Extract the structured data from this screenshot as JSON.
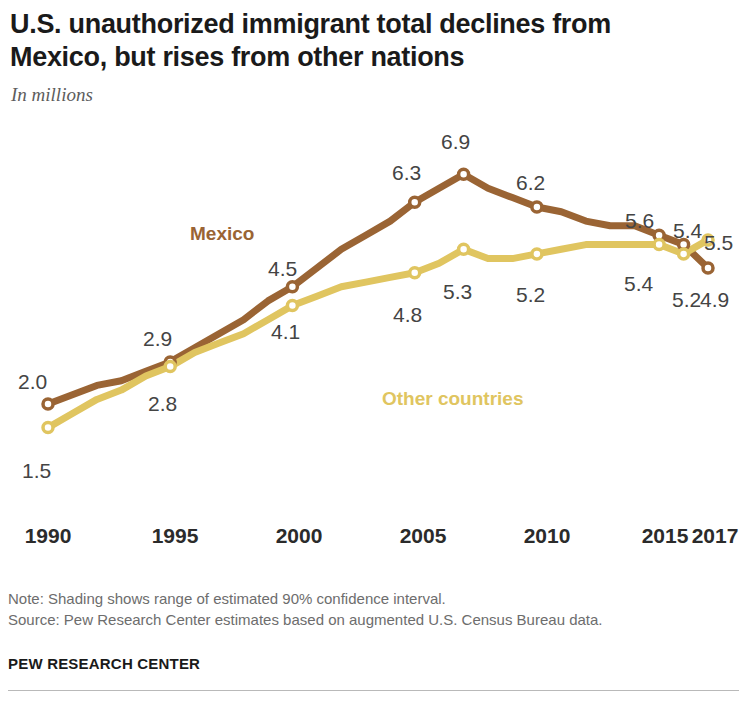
{
  "header": {
    "title": "U.S. unauthorized immigrant total declines from Mexico, but rises from other nations",
    "subtitle": "In millions"
  },
  "footer": {
    "note": "Note: Shading shows range of estimated 90% confidence interval.",
    "source": "Source: Pew Research Center estimates based on augmented U.S. Census Bureau data.",
    "brand": "PEW RESEARCH CENTER"
  },
  "colors": {
    "mexico": "#9a6434",
    "other": "#e0c560",
    "label": "#444444",
    "axis": "#2b2b2b",
    "title": "#1a1a1a",
    "note": "#6d6d6d"
  },
  "chart_data": {
    "type": "line",
    "title": "U.S. unauthorized immigrant total declines from Mexico, but rises from other nations",
    "subtitle": "In millions",
    "xlabel": "",
    "ylabel": "In millions",
    "ylim": [
      0,
      7.5
    ],
    "xlim": [
      1990,
      2017
    ],
    "grid": false,
    "legend_position": "inline",
    "xticks": [
      "1990",
      "1995",
      "2000",
      "2005",
      "2010",
      "2015",
      "2017"
    ],
    "xtick_values": [
      1990,
      1995,
      2000,
      2005,
      2010,
      2015,
      2017
    ],
    "x": [
      1990,
      1991,
      1992,
      1993,
      1994,
      1995,
      1996,
      1997,
      1998,
      1999,
      2000,
      2001,
      2002,
      2003,
      2004,
      2005,
      2006,
      2007,
      2008,
      2009,
      2010,
      2011,
      2012,
      2013,
      2014,
      2015,
      2016,
      2017
    ],
    "series": [
      {
        "name": "Mexico",
        "color": "#9a6434",
        "values": [
          2.0,
          2.2,
          2.4,
          2.5,
          2.7,
          2.9,
          3.2,
          3.5,
          3.8,
          4.2,
          4.5,
          4.9,
          5.3,
          5.6,
          5.9,
          6.3,
          6.6,
          6.9,
          6.6,
          6.4,
          6.2,
          6.1,
          5.9,
          5.8,
          5.8,
          5.6,
          5.4,
          4.9
        ],
        "labeled_points": [
          {
            "x": 1990,
            "value": "2.0"
          },
          {
            "x": 1995,
            "value": "2.9"
          },
          {
            "x": 2000,
            "value": "4.5"
          },
          {
            "x": 2005,
            "value": "6.3"
          },
          {
            "x": 2007,
            "value": "6.9"
          },
          {
            "x": 2010,
            "value": "6.2"
          },
          {
            "x": 2015,
            "value": "5.6"
          },
          {
            "x": 2016,
            "value": "5.4"
          },
          {
            "x": 2017,
            "value": "4.9"
          }
        ]
      },
      {
        "name": "Other countries",
        "color": "#e0c560",
        "values": [
          1.5,
          1.8,
          2.1,
          2.3,
          2.6,
          2.8,
          3.1,
          3.3,
          3.5,
          3.8,
          4.1,
          4.3,
          4.5,
          4.6,
          4.7,
          4.8,
          5.0,
          5.3,
          5.1,
          5.1,
          5.2,
          5.3,
          5.4,
          5.4,
          5.4,
          5.4,
          5.2,
          5.5
        ],
        "labeled_points": [
          {
            "x": 1990,
            "value": "1.5"
          },
          {
            "x": 1995,
            "value": "2.8"
          },
          {
            "x": 2000,
            "value": "4.1"
          },
          {
            "x": 2005,
            "value": "4.8"
          },
          {
            "x": 2007,
            "value": "5.3"
          },
          {
            "x": 2010,
            "value": "5.2"
          },
          {
            "x": 2015,
            "value": "5.4"
          },
          {
            "x": 2016,
            "value": "5.2"
          },
          {
            "x": 2017,
            "value": "5.5"
          }
        ]
      }
    ],
    "annotations": [
      {
        "text": "Mexico",
        "color": "#9a6434"
      },
      {
        "text": "Other countries",
        "color": "#e0c560"
      }
    ]
  },
  "labels": {
    "mexico_series": "Mexico",
    "other_series": "Other countries",
    "m1990": "2.0",
    "m1995": "2.9",
    "m2000": "4.5",
    "m2005": "6.3",
    "m2007": "6.9",
    "m2010": "6.2",
    "m2015": "5.6",
    "m2016": "5.4",
    "m2017": "4.9",
    "o1990": "1.5",
    "o1995": "2.8",
    "o2000": "4.1",
    "o2005": "4.8",
    "o2007": "5.3",
    "o2010": "5.2",
    "o2015": "5.4",
    "o2016": "5.2",
    "o2017": "5.5",
    "x1990": "1990",
    "x1995": "1995",
    "x2000": "2000",
    "x2005": "2005",
    "x2010": "2010",
    "x2015": "2015",
    "x2017": "2017"
  }
}
